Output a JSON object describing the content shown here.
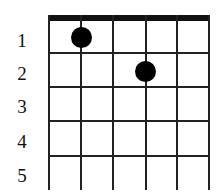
{
  "diagram": {
    "type": "chord-chart",
    "strings": 6,
    "fret_labels": [
      "1",
      "2",
      "3",
      "4",
      "5"
    ],
    "dots": [
      {
        "fret": 1,
        "string": 2
      },
      {
        "fret": 2,
        "string": 4
      }
    ]
  }
}
